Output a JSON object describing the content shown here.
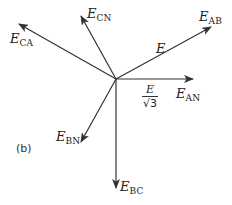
{
  "diagram": {
    "panel_label": "(b)",
    "origin": [
      116,
      79
    ],
    "line_color": "#333333",
    "phasors": [
      {
        "id": "AB",
        "label_main": "E",
        "label_sub": "AB",
        "tip": [
          211,
          27
        ]
      },
      {
        "id": "AN",
        "label_main": "E",
        "label_sub": "AN",
        "tip": [
          193,
          79
        ]
      },
      {
        "id": "CN",
        "label_main": "E",
        "label_sub": "CN",
        "tip": [
          81,
          16
        ]
      },
      {
        "id": "CA",
        "label_main": "E",
        "label_sub": "CA",
        "tip": [
          19,
          24
        ]
      },
      {
        "id": "BN",
        "label_main": "E",
        "label_sub": "BN",
        "tip": [
          81,
          142
        ]
      },
      {
        "id": "BC",
        "label_main": "E",
        "label_sub": "BC",
        "tip": [
          116,
          188
        ]
      }
    ],
    "magnitude_labels": {
      "line": "E",
      "phase_numerator": "E",
      "phase_denominator": "√3"
    }
  }
}
